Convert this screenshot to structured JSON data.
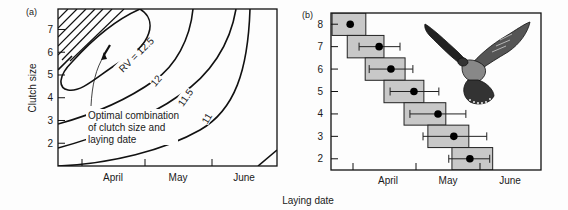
{
  "xlabel_shared": "Laying date",
  "chart_data": [
    {
      "panel": "(a)",
      "type": "contour",
      "title": "",
      "xlabel": "",
      "ylabel": "Clutch size",
      "x_tick_labels": [
        "April",
        "May",
        "June"
      ],
      "y_ticks": [
        2,
        3,
        4,
        5,
        6,
        7
      ],
      "ylim": [
        1,
        7.9
      ],
      "contours": [
        {
          "level": 12.5,
          "label": "RV = 12.5"
        },
        {
          "level": 12,
          "label": "12"
        },
        {
          "level": 11.5,
          "label": "11.5"
        },
        {
          "level": 11,
          "label": "11"
        }
      ],
      "optimum": {
        "clutch_size": 6.2,
        "label": "Optimal combination of clutch size and laying date"
      },
      "hatched_region": "top-left (infeasible)"
    },
    {
      "panel": "(b)",
      "type": "scatter",
      "title": "",
      "xlabel": "",
      "ylabel": "",
      "x_tick_labels": [
        "April",
        "May",
        "June"
      ],
      "y_ticks": [
        2,
        3,
        4,
        5,
        6,
        7,
        8
      ],
      "ylim": [
        1.5,
        8.5
      ],
      "x_units": "days (relative, tick spacing = 30)",
      "xlim": [
        -10.5,
        89
      ],
      "points": [
        {
          "clutch": 8,
          "mean": -1.4,
          "err": null,
          "box": [
            -10,
            6
          ]
        },
        {
          "clutch": 7,
          "mean": 12.3,
          "err": [
            2.8,
            22.2
          ],
          "box": [
            -2.8,
            14.6
          ]
        },
        {
          "clutch": 6,
          "mean": 17.9,
          "err": [
            7.6,
            28.3
          ],
          "box": [
            5.7,
            24.6
          ]
        },
        {
          "clutch": 5,
          "mean": 28.8,
          "err": [
            17.5,
            40.6
          ],
          "box": [
            14.6,
            33.5
          ]
        },
        {
          "clutch": 4,
          "mean": 40.2,
          "err": [
            26.9,
            53.4
          ],
          "box": [
            24.1,
            43.9
          ]
        },
        {
          "clutch": 3,
          "mean": 47.7,
          "err": [
            33.1,
            63.3
          ],
          "box": [
            35.4,
            54.8
          ]
        },
        {
          "clutch": 2,
          "mean": 55.3,
          "err": [
            45.3,
            64.7
          ],
          "box": [
            46.8,
            66.1
          ]
        }
      ],
      "illustration": "kestrel in flight"
    }
  ]
}
